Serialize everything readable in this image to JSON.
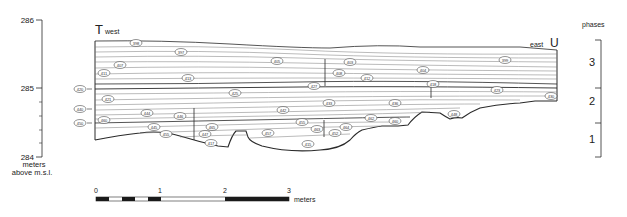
{
  "elevation_axis": {
    "ticks": [
      {
        "label": "286",
        "y": 20
      },
      {
        "label": "285",
        "y": 88
      },
      {
        "label": "284",
        "y": 156
      }
    ],
    "unit_line1": "meters",
    "unit_line2": "above m.s.l."
  },
  "section": {
    "west_letter": "T",
    "west_label": "west",
    "east_label": "east",
    "east_letter": "U"
  },
  "phases": {
    "title": "phases",
    "items": [
      {
        "label": "3",
        "y_top": 40,
        "y_bottom": 88
      },
      {
        "label": "2",
        "y_top": 88,
        "y_bottom": 123
      },
      {
        "label": "1",
        "y_top": 123,
        "y_bottom": 157
      }
    ]
  },
  "scale_bar": {
    "ticks": [
      "0",
      "1",
      "2",
      "3"
    ],
    "unit": "meters"
  },
  "side_markers": [
    {
      "label": "420",
      "y": 89
    },
    {
      "label": "440",
      "y": 109
    },
    {
      "label": "450",
      "y": 123
    }
  ],
  "layer_labels": [
    {
      "label": "398",
      "x": 136,
      "y": 43
    },
    {
      "label": "397",
      "x": 181,
      "y": 52
    },
    {
      "label": "407",
      "x": 120,
      "y": 65
    },
    {
      "label": "411",
      "x": 104,
      "y": 73
    },
    {
      "label": "413",
      "x": 188,
      "y": 78
    },
    {
      "label": "405",
      "x": 277,
      "y": 61
    },
    {
      "label": "403",
      "x": 350,
      "y": 62
    },
    {
      "label": "408",
      "x": 339,
      "y": 73
    },
    {
      "label": "412",
      "x": 367,
      "y": 78
    },
    {
      "label": "404",
      "x": 423,
      "y": 70
    },
    {
      "label": "399",
      "x": 505,
      "y": 60
    },
    {
      "label": "421",
      "x": 108,
      "y": 99
    },
    {
      "label": "425",
      "x": 235,
      "y": 93
    },
    {
      "label": "427",
      "x": 314,
      "y": 86
    },
    {
      "label": "418",
      "x": 433,
      "y": 84
    },
    {
      "label": "423",
      "x": 497,
      "y": 90
    },
    {
      "label": "430",
      "x": 551,
      "y": 96
    },
    {
      "label": "444",
      "x": 147,
      "y": 113
    },
    {
      "label": "442",
      "x": 283,
      "y": 110
    },
    {
      "label": "433",
      "x": 329,
      "y": 103
    },
    {
      "label": "436",
      "x": 395,
      "y": 103
    },
    {
      "label": "446",
      "x": 180,
      "y": 116
    },
    {
      "label": "460",
      "x": 104,
      "y": 120
    },
    {
      "label": "445",
      "x": 154,
      "y": 127
    },
    {
      "label": "455",
      "x": 166,
      "y": 134
    },
    {
      "label": "465",
      "x": 212,
      "y": 127
    },
    {
      "label": "447",
      "x": 205,
      "y": 134
    },
    {
      "label": "417",
      "x": 211,
      "y": 143
    },
    {
      "label": "455b",
      "x": 302,
      "y": 122
    },
    {
      "label": "463",
      "x": 317,
      "y": 129
    },
    {
      "label": "457",
      "x": 268,
      "y": 133
    },
    {
      "label": "452",
      "x": 335,
      "y": 133
    },
    {
      "label": "464",
      "x": 346,
      "y": 127
    },
    {
      "label": "462",
      "x": 371,
      "y": 118
    },
    {
      "label": "460b",
      "x": 395,
      "y": 121
    },
    {
      "label": "448",
      "x": 454,
      "y": 114
    },
    {
      "label": "415",
      "x": 308,
      "y": 144
    }
  ],
  "colors": {
    "line": "#2a2a2a",
    "strata": "#777777",
    "label_fill": "#ffffff"
  }
}
